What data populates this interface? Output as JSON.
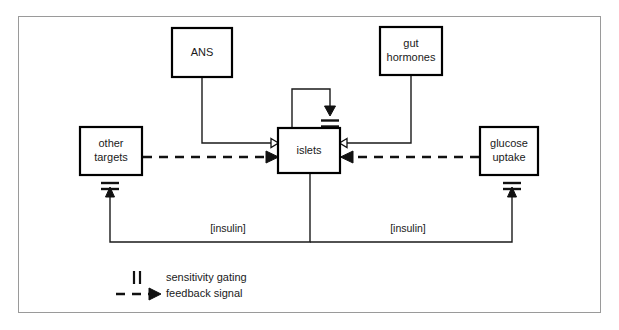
{
  "figure": {
    "type": "diagram",
    "subtype": "block-flow-control-diagram",
    "title": "",
    "frame_color": "#9a9a9a",
    "background": "#ffffff",
    "ink_color": "#111111"
  },
  "nodes": [
    {
      "id": "ans",
      "label": "ANS",
      "x": 172,
      "y": 28,
      "w": 60,
      "h": 49
    },
    {
      "id": "gut_hormones",
      "label_line1": "gut",
      "label_line2": "hormones",
      "x": 380,
      "y": 27,
      "w": 62,
      "h": 48
    },
    {
      "id": "other_targets",
      "label_line1": "other",
      "label_line2": "targets",
      "x": 80,
      "y": 127,
      "w": 62,
      "h": 48
    },
    {
      "id": "islets",
      "label": "islets",
      "x": 278,
      "y": 128,
      "w": 62,
      "h": 45
    },
    {
      "id": "glucose_uptake",
      "label_line1": "glucose",
      "label_line2": "uptake",
      "x": 480,
      "y": 127,
      "w": 58,
      "h": 48
    }
  ],
  "edges": [
    {
      "id": "ans-to-islets",
      "from": "ans",
      "to": "islets",
      "style": "solid",
      "arrowhead": "open",
      "label": ""
    },
    {
      "id": "gut-to-islets",
      "from": "gut_hormones",
      "to": "islets",
      "style": "solid",
      "arrowhead": "open",
      "label": ""
    },
    {
      "id": "other-targets-to-islets",
      "from": "other_targets",
      "to": "islets",
      "style": "dashed",
      "arrowhead": "filled",
      "label": ""
    },
    {
      "id": "glucose-uptake-to-islets",
      "from": "glucose_uptake",
      "to": "islets",
      "style": "dashed",
      "arrowhead": "filled",
      "label": ""
    },
    {
      "id": "islets-self-loop",
      "from": "islets",
      "to": "islets",
      "style": "solid",
      "arrowhead": "filled",
      "label": "",
      "gated": true
    },
    {
      "id": "islets-to-other-targets",
      "from": "islets",
      "to": "other_targets",
      "style": "solid",
      "arrowhead": "filled",
      "label": "[insulin]",
      "gated": true
    },
    {
      "id": "islets-to-glucose-uptake",
      "from": "islets",
      "to": "glucose_uptake",
      "style": "solid",
      "arrowhead": "filled",
      "label": "[insulin]",
      "gated": true
    }
  ],
  "edge_labels": {
    "insulin_left": "[insulin]",
    "insulin_right": "[insulin]"
  },
  "legend": {
    "items": [
      {
        "symbol": "sensitivity-gating-symbol",
        "label": "sensitivity gating"
      },
      {
        "symbol": "dashed-arrow-symbol",
        "label": "feedback signal"
      }
    ]
  }
}
